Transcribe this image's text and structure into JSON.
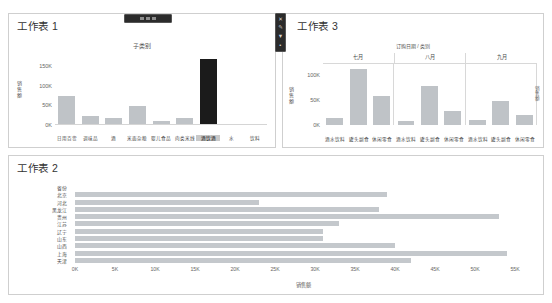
{
  "dashboard": {
    "background": "#ffffff",
    "bar_color": "#c4c8cc",
    "selected_bar_color": "#1b1b1b"
  },
  "worksheet1": {
    "title": "工作表 1",
    "chart_caption": "子类别",
    "y_axis_title": "销售额",
    "y_ticks": [
      "0K",
      "50K",
      "100K",
      "150K"
    ]
  },
  "worksheet2": {
    "title": "工作表 2",
    "y_axis_title": "省份",
    "x_axis_title": "销售额",
    "x_ticks": [
      "0K",
      "5K",
      "10K",
      "15K",
      "20K",
      "25K",
      "30K",
      "35K",
      "40K",
      "45K",
      "50K",
      "55K"
    ]
  },
  "worksheet3": {
    "title": "工作表 3",
    "chart_caption": "订购日期 / 类别",
    "y_axis_title": "销售额",
    "y_ticks": [
      "0K",
      "50K",
      "100K"
    ],
    "side_label": "销售额"
  },
  "toolbar_top": {
    "name": "floating-toolbar"
  },
  "toolbar_right": {
    "items": [
      {
        "name": "close-icon",
        "glyph": "✕"
      },
      {
        "name": "edit-icon",
        "glyph": "✎"
      },
      {
        "name": "filter-icon",
        "glyph": "▼"
      },
      {
        "name": "more-icon",
        "glyph": "▪"
      }
    ]
  },
  "chart_data": [
    {
      "id": "worksheet1",
      "type": "bar",
      "title": "工作表 1",
      "subtitle": "子类别",
      "xlabel": "子类别",
      "ylabel": "销售额",
      "ylim": [
        0,
        175000
      ],
      "y_ticks": [
        0,
        50000,
        100000,
        150000
      ],
      "grid": false,
      "legend": "none",
      "categories": [
        "日用百货",
        "调味品",
        "酒",
        "米面杂粮",
        "婴儿食品",
        "肉类米线",
        "酒饮酒",
        "水",
        "饮料"
      ],
      "values": [
        74000,
        24000,
        19000,
        49000,
        11000,
        19000,
        168000,
        2000,
        3000
      ],
      "selected_index": 6,
      "selected_label": "酒饮酒"
    },
    {
      "id": "worksheet2",
      "type": "bar",
      "orientation": "horizontal",
      "title": "工作表 2",
      "xlabel": "销售额",
      "ylabel": "省份",
      "xlim": [
        0,
        57000
      ],
      "x_ticks": [
        0,
        5000,
        10000,
        15000,
        20000,
        25000,
        30000,
        35000,
        40000,
        45000,
        50000,
        55000
      ],
      "grid": false,
      "legend": "none",
      "categories": [
        "省份",
        "北京",
        "河北",
        "黑龙江",
        "贵州",
        "江苏",
        "辽宁",
        "山东",
        "山西",
        "上海",
        "天津"
      ],
      "values": [
        0,
        39000,
        23000,
        38000,
        53000,
        33000,
        31000,
        31000,
        40000,
        54000,
        42000
      ]
    },
    {
      "id": "worksheet3",
      "type": "bar",
      "title": "工作表 3",
      "subtitle": "订购日期 / 类别",
      "xlabel": "订购日期 / 类别",
      "ylabel": "销售额",
      "ylim": [
        0,
        125000
      ],
      "y_ticks": [
        0,
        50000,
        100000
      ],
      "grid": false,
      "legend": "none",
      "panels": [
        "七月",
        "八月",
        "九月"
      ],
      "categories": [
        "酒水饮料",
        "罐头副食",
        "休闲零食"
      ],
      "series": [
        {
          "name": "七月",
          "values": [
            14000,
            113000,
            58000
          ]
        },
        {
          "name": "八月",
          "values": [
            8000,
            78000,
            28000
          ]
        },
        {
          "name": "九月",
          "values": [
            10000,
            49000,
            21000
          ]
        }
      ]
    }
  ]
}
